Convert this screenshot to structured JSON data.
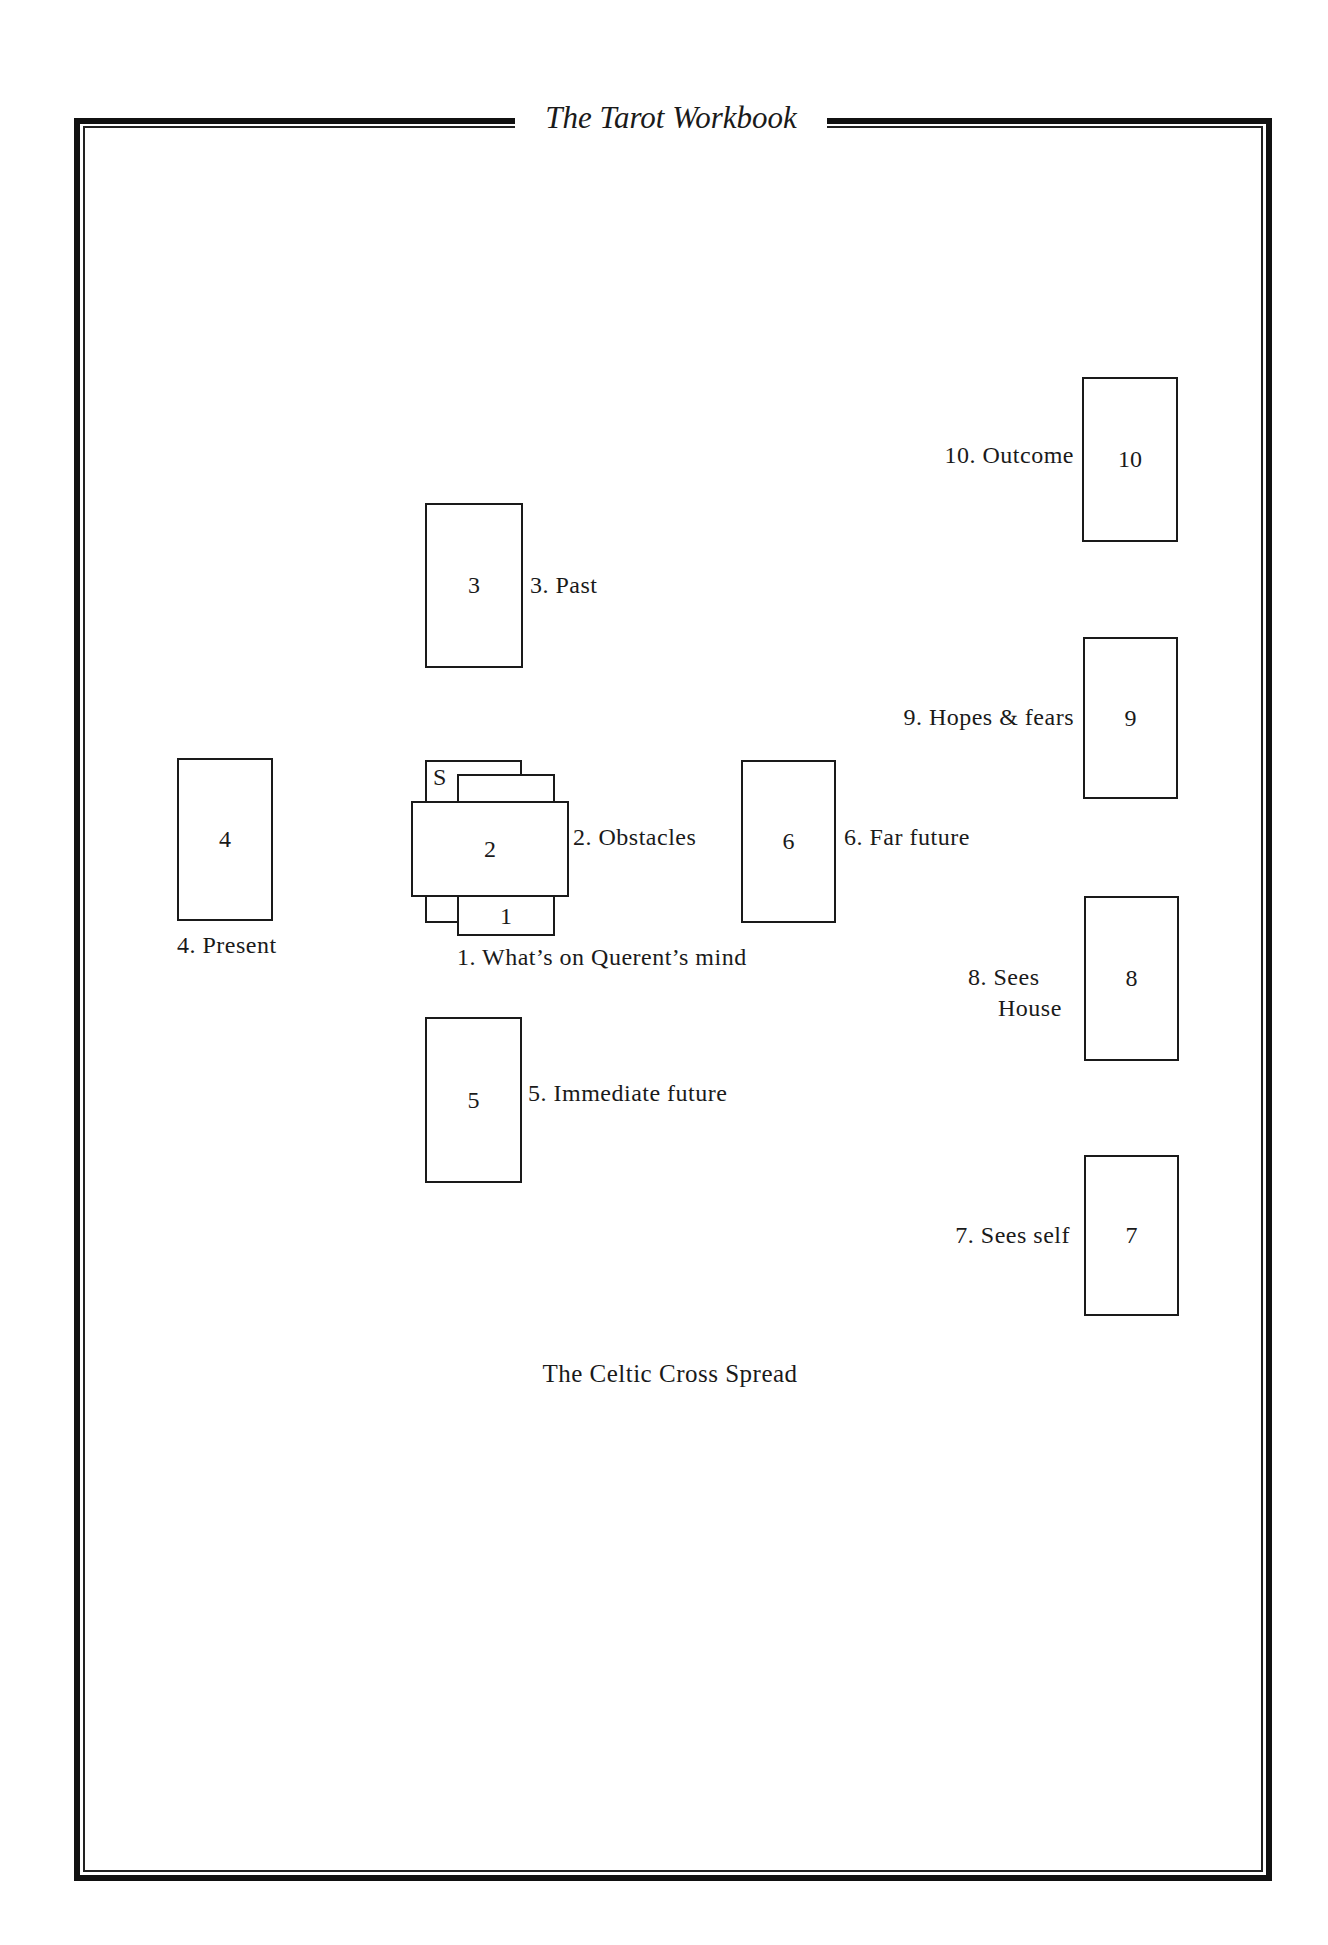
{
  "header": {
    "title": "The Tarot Workbook"
  },
  "cards": {
    "s": {
      "number": "S"
    },
    "c1": {
      "number": "1",
      "label": "1. What’s on Querent’s mind"
    },
    "c2": {
      "number": "2",
      "label": "2. Obstacles"
    },
    "c3": {
      "number": "3",
      "label": "3. Past"
    },
    "c4": {
      "number": "4",
      "label": "4. Present"
    },
    "c5": {
      "number": "5",
      "label": "5. Immediate future"
    },
    "c6": {
      "number": "6",
      "label": "6. Far future"
    },
    "c7": {
      "number": "7",
      "label": "7. Sees self"
    },
    "c8": {
      "number": "8",
      "label_line1": "8. Sees",
      "label_line2": "House"
    },
    "c9": {
      "number": "9",
      "label": "9. Hopes & fears"
    },
    "c10": {
      "number": "10",
      "label": "10. Outcome"
    }
  },
  "caption": "The Celtic Cross Spread"
}
